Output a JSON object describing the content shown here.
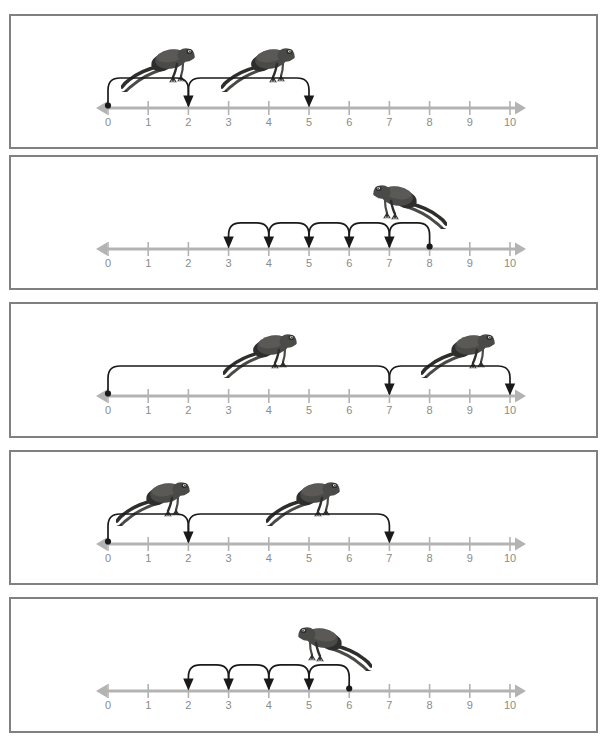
{
  "page": {
    "width": 611,
    "height": 746,
    "background": "#ffffff"
  },
  "style": {
    "panel_border_color": "#808080",
    "numberline_color": "#b3b3b3",
    "tick_color": "#b3b3b3",
    "label_color": "#8a8a8a",
    "arrow_color": "#1a1a1a",
    "frog_body_color": "#4a4a48",
    "frog_dark_color": "#2e2e2c",
    "frog_light_color": "#6e6d68"
  },
  "numberline": {
    "min": 0,
    "max": 10,
    "tick_labels": [
      "0",
      "1",
      "2",
      "3",
      "4",
      "5",
      "6",
      "7",
      "8",
      "9",
      "10"
    ],
    "left_arrowhead": true,
    "right_arrowhead": true
  },
  "panels": [
    {
      "id": "panel-1",
      "index": 1,
      "top": 14,
      "height": 135,
      "jumps": [
        {
          "from": 0,
          "to": 2,
          "direction": "forward",
          "label": "0 to 2"
        },
        {
          "from": 2,
          "to": 5,
          "direction": "forward",
          "label": "2 to 5"
        }
      ],
      "start_dot_at": 0,
      "arrowheads_at": [
        2,
        5
      ],
      "frogs": [
        {
          "x": 110,
          "y": 26,
          "facing": "right"
        },
        {
          "x": 210,
          "y": 26,
          "facing": "right"
        }
      ],
      "answer": {
        "start": 0,
        "end": 5,
        "jump_count": 2
      }
    },
    {
      "id": "panel-2",
      "index": 2,
      "top": 155,
      "height": 135,
      "jumps": [
        {
          "from": 8,
          "to": 7,
          "direction": "backward",
          "label": "8 to 7"
        },
        {
          "from": 7,
          "to": 6,
          "direction": "backward",
          "label": "7 to 6"
        },
        {
          "from": 6,
          "to": 5,
          "direction": "backward",
          "label": "6 to 5"
        },
        {
          "from": 5,
          "to": 4,
          "direction": "backward",
          "label": "5 to 4"
        },
        {
          "from": 4,
          "to": 3,
          "direction": "backward",
          "label": "4 to 3"
        }
      ],
      "start_dot_at": 8,
      "arrowheads_at": [
        7,
        6,
        5,
        4,
        3
      ],
      "frogs": [
        {
          "x": 360,
          "y": 22,
          "facing": "left"
        }
      ],
      "answer": {
        "start": 8,
        "end": 3,
        "jump_count": 5
      }
    },
    {
      "id": "panel-3",
      "index": 3,
      "top": 302,
      "height": 136,
      "jumps": [
        {
          "from": 0,
          "to": 7,
          "direction": "forward",
          "label": "0 to 7"
        },
        {
          "from": 7,
          "to": 10,
          "direction": "forward",
          "label": "7 to 10"
        }
      ],
      "start_dot_at": 0,
      "arrowheads_at": [
        7,
        10
      ],
      "frogs": [
        {
          "x": 212,
          "y": 24,
          "facing": "right"
        },
        {
          "x": 410,
          "y": 24,
          "facing": "right"
        }
      ],
      "answer": {
        "start": 0,
        "end": 10,
        "jump_count": 2
      }
    },
    {
      "id": "panel-4",
      "index": 4,
      "top": 450,
      "height": 135,
      "jumps": [
        {
          "from": 0,
          "to": 2,
          "direction": "forward",
          "label": "0 to 2"
        },
        {
          "from": 2,
          "to": 7,
          "direction": "forward",
          "label": "2 to 7"
        }
      ],
      "start_dot_at": 0,
      "arrowheads_at": [
        2,
        7
      ],
      "frogs": [
        {
          "x": 105,
          "y": 24,
          "facing": "right"
        },
        {
          "x": 255,
          "y": 24,
          "facing": "right"
        }
      ],
      "answer": {
        "start": 0,
        "end": 7,
        "jump_count": 2
      }
    },
    {
      "id": "panel-5",
      "index": 5,
      "top": 597,
      "height": 136,
      "jumps": [
        {
          "from": 6,
          "to": 5,
          "direction": "backward",
          "label": "6 to 5"
        },
        {
          "from": 5,
          "to": 4,
          "direction": "backward",
          "label": "5 to 4"
        },
        {
          "from": 4,
          "to": 3,
          "direction": "backward",
          "label": "4 to 3"
        },
        {
          "from": 3,
          "to": 2,
          "direction": "backward",
          "label": "3 to 2"
        }
      ],
      "start_dot_at": 6,
      "arrowheads_at": [
        5,
        4,
        3,
        2
      ],
      "frogs": [
        {
          "x": 285,
          "y": 22,
          "facing": "left"
        }
      ],
      "answer": {
        "start": 6,
        "end": 2,
        "jump_count": 4
      }
    }
  ],
  "geometry": {
    "axis_y_from_panel_top": 92,
    "label_y_from_panel_top": 100,
    "tick_half_height": 7,
    "x_at_zero": 97,
    "unit_px": 40.2,
    "arc_top_offset": 30,
    "left_arrow_tip": 85,
    "right_arrow_tip": 515
  }
}
